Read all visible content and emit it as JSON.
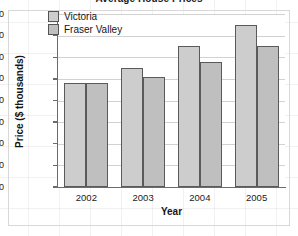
{
  "chart_data": {
    "type": "bar",
    "title": "Average House Prices",
    "xlabel": "Year",
    "ylabel": "Price ($ thousands)",
    "categories": [
      "2002",
      "2003",
      "2004",
      "2005"
    ],
    "series": [
      {
        "name": "Victoria",
        "color": "#cdcdcd",
        "values": [
          240,
          275,
          325,
          375
        ]
      },
      {
        "name": "Fraser Valley",
        "color": "#bfbfbf",
        "values": [
          240,
          255,
          290,
          325
        ]
      }
    ],
    "ylim": [
      0,
      400
    ],
    "ytick_labels": [
      "0",
      "50",
      "100",
      "150",
      "200",
      "250",
      "300",
      "350",
      "400"
    ],
    "ytick_values": [
      0,
      50,
      100,
      150,
      200,
      250,
      300,
      350,
      400
    ],
    "ytick_step": 50,
    "grid": "horizontal",
    "legend_position": "top-left-inside",
    "bar_border_color": "#5a5a5a",
    "axis_color": "#6b6b6b",
    "gridline_color": "#d2d2d2"
  },
  "legend": {
    "items": [
      {
        "label": "Victoria"
      },
      {
        "label": "Fraser Valley"
      }
    ]
  }
}
